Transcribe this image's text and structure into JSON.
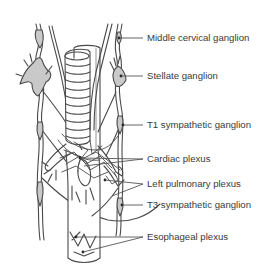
{
  "figure": {
    "colors": {
      "outline": "#4a4a4a",
      "ganglion_fill": "#c9c9c9",
      "leader": "#555555",
      "text": "#3a3a3a",
      "background": "#ffffff"
    }
  },
  "labels": [
    {
      "id": "middle-cervical-ganglion",
      "text": "Middle cervical ganglion",
      "y": 38
    },
    {
      "id": "stellate-ganglion",
      "text": "Stellate ganglion",
      "y": 76
    },
    {
      "id": "t1-sympathetic-ganglion",
      "text": "T1 sympathetic ganglion",
      "y": 125
    },
    {
      "id": "cardiac-plexus",
      "text": "Cardiac plexus",
      "y": 159
    },
    {
      "id": "left-pulmonary-plexus",
      "text": "Left pulmonary plexus",
      "y": 184
    },
    {
      "id": "t3-sympathetic-ganglion",
      "text": "T3 sympathetic ganglion",
      "y": 205
    },
    {
      "id": "esophageal-plexus",
      "text": "Esophageal plexus",
      "y": 237
    }
  ]
}
